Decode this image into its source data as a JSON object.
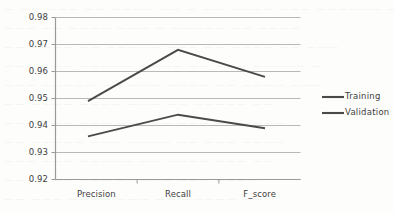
{
  "chart_data": {
    "type": "line",
    "title": "",
    "subtitle": "",
    "xlabel": "",
    "ylabel": "",
    "categories": [
      "Precision",
      "Recall",
      "F_score"
    ],
    "series": [
      {
        "name": "Training",
        "values": [
          0.936,
          0.944,
          0.939
        ],
        "color": "#4a4a4a"
      },
      {
        "name": "Validation",
        "values": [
          0.949,
          0.968,
          0.958
        ],
        "color": "#4a4a4a"
      }
    ],
    "ylim": [
      0.92,
      0.98
    ],
    "ytick_labels": [
      "0.98",
      "0.97",
      "0.96",
      "0.95",
      "0.94",
      "0.93",
      "0.92"
    ],
    "ytick_values": [
      0.98,
      0.97,
      0.96,
      0.95,
      0.94,
      0.93,
      0.92
    ],
    "grid": true,
    "grid_axis": "y",
    "legend_position": "right",
    "legend_entries": [
      "Training",
      "Validation"
    ]
  },
  "colors": {
    "background": "#fdfdfc",
    "gridline": "#b9b9b9",
    "axis": "#9a9a9a",
    "series_line": "#4a4a4a",
    "tick_text": "#3d3d3d"
  },
  "scan_artifact_lines": [
    "— —— ———  —— ———— ——  — —— ———— ———  —————— ——",
    "  ———  —— ————  ——— — ————— ——  ————",
    "—— ———— ——  ————— ——— —— ————  —— ———",
    " ————  —— ————— ————  —— ——— ————— —",
    "——— ————— ——  ——— ———— ——  ———— ———",
    "  —— ———— ————  ——— —— —————  ——",
    "———— ——  ——— ————— ———  —— ————",
    " —— ————— ———  ———— —— ———  ————",
    "——— ——— —————  —— ———— ——— ——",
    "  ———— —— ———  ————— ——— ————",
    "—— ——— ———— ———  —— ————— ——"
  ]
}
